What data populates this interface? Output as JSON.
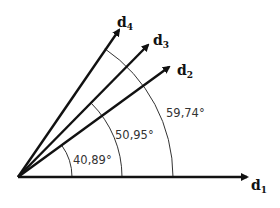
{
  "diagram": {
    "vectors": [
      {
        "name": "d",
        "subscript": "1"
      },
      {
        "name": "d",
        "subscript": "2"
      },
      {
        "name": "d",
        "subscript": "3"
      },
      {
        "name": "d",
        "subscript": "4"
      }
    ],
    "angles": [
      {
        "label": "40,89°",
        "between": "d1-d2"
      },
      {
        "label": "50,95°",
        "between": "d1-d3"
      },
      {
        "label": "59,74°",
        "between": "d1-d4"
      }
    ]
  }
}
